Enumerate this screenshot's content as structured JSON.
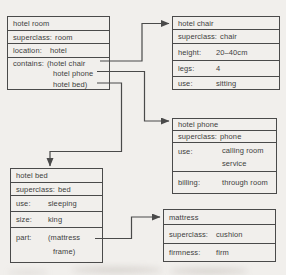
{
  "colors": {
    "background": "#f1efec",
    "line": "#4a4a4a",
    "text": "#3e3e3e"
  },
  "frames": [
    {
      "title": "hotel room",
      "rows": [
        {
          "label": "superclass:",
          "value": "room"
        },
        {
          "label": "location:",
          "value": "hotel"
        },
        {
          "label": "contains:",
          "value_lines": [
            "(hotel chair",
            "hotel phone",
            "hotel bed)"
          ]
        }
      ]
    },
    {
      "title": "hotel chair",
      "rows": [
        {
          "label": "superclass:",
          "value": "chair"
        },
        {
          "label": "height:",
          "value": "20–40cm"
        },
        {
          "label": "legs:",
          "value": "4"
        },
        {
          "label": "use:",
          "value": "sitting"
        }
      ]
    },
    {
      "title": "hotel phone",
      "rows": [
        {
          "label": "superclass:",
          "value": "phone"
        },
        {
          "label": "use:",
          "value_lines": [
            "calling room",
            "service"
          ]
        },
        {
          "label": "billing:",
          "value": "through room"
        }
      ]
    },
    {
      "title": "hotel bed",
      "rows": [
        {
          "label": "superclass:",
          "value": "bed"
        },
        {
          "label": "use:",
          "value": "sleeping"
        },
        {
          "label": "size:",
          "value": "king"
        },
        {
          "label": "part:",
          "value_lines": [
            "(mattress",
            "frame)"
          ]
        }
      ]
    },
    {
      "title": "mattress",
      "rows": [
        {
          "label": "superclass:",
          "value": "cushion"
        },
        {
          "label": "firmness:",
          "value": "firm"
        }
      ]
    }
  ],
  "connections": [
    {
      "from": "hotel room / contains: hotel chair",
      "to": "hotel chair"
    },
    {
      "from": "hotel room / contains: hotel phone",
      "to": "hotel phone"
    },
    {
      "from": "hotel room / contains: hotel bed",
      "to": "hotel bed"
    },
    {
      "from": "hotel bed / part: mattress",
      "to": "mattress"
    }
  ]
}
